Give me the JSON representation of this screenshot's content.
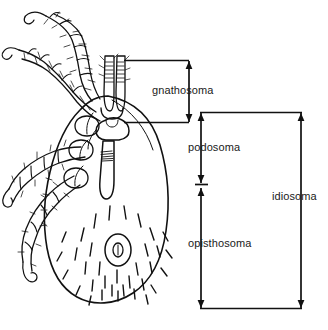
{
  "figure": {
    "background_color": "#ffffff",
    "line_color": "#111111",
    "text_color": "#1a1a1a",
    "width": 328,
    "height": 330
  },
  "labels": {
    "gnathosoma": "gnathosoma",
    "podosoma": "podosoma",
    "opisthosoma": "opisthosoma",
    "idiosoma": "idiosoma"
  },
  "brackets": [
    {
      "name": "gnathosoma",
      "label": "gnathosoma",
      "type": "double-arrow-vertical",
      "top_rule_y": 60,
      "bottom_rule_y": 122,
      "rule_x_start": 124,
      "rule_x_end": 189,
      "arrow_x": 189,
      "arrow_top_y": 66,
      "arrow_bottom_y": 117
    },
    {
      "name": "podosoma",
      "label": "podosoma",
      "type": "double-arrow-vertical",
      "arrow_x": 201,
      "arrow_top_y": 114,
      "arrow_bottom_y": 183,
      "tick_y": 184,
      "tick_x_start": 195,
      "tick_x_end": 207
    },
    {
      "name": "opisthosoma",
      "label": "opisthosoma",
      "type": "double-arrow-vertical",
      "arrow_x": 201,
      "arrow_top_y": 188,
      "arrow_bottom_y": 307
    },
    {
      "name": "idiosoma",
      "label": "idiosoma",
      "type": "double-arrow-vertical",
      "arrow_x": 301,
      "arrow_top_y": 114,
      "arrow_bottom_y": 307,
      "top_rule_y": 112,
      "bottom_rule_y": 308,
      "rule_x_start": 200,
      "rule_x_end": 302
    }
  ],
  "anatomy_parts": [
    "foreleg-upper",
    "foreleg-lower",
    "leg-two",
    "leg-three",
    "leg-four",
    "palps",
    "hypostome",
    "scutum",
    "idiosoma-body",
    "genital-pore",
    "setae"
  ]
}
